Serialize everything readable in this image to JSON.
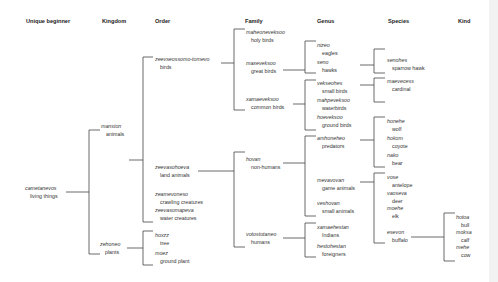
{
  "headers": {
    "unique_beginner": "Unique beginner",
    "kingdom": "Kingdom",
    "order": "Order",
    "family": "Family",
    "genus": "Genus",
    "species": "Species",
    "kind": "Kind"
  },
  "unique_beginner": {
    "name": "cametanevos",
    "gloss": "living things"
  },
  "kingdom": [
    {
      "name": "manston",
      "gloss": "animals"
    },
    {
      "name": "zehoneo",
      "gloss": "plants"
    }
  ],
  "order": [
    {
      "name": "zeevseossomo-tomevo",
      "gloss": "birds"
    },
    {
      "name": "zeevasohoeva",
      "gloss": "land animals"
    },
    {
      "name": "zeamevoneso",
      "gloss": "crawling creatures"
    },
    {
      "name": "zeevasomapeva",
      "gloss": "water creatures"
    },
    {
      "name": "hoxzz",
      "gloss": "tree"
    },
    {
      "name": "moez",
      "gloss": "ground plant"
    }
  ],
  "family": [
    {
      "name": "maheoneveksoo",
      "gloss": "holy birds"
    },
    {
      "name": "maxeveksoo",
      "gloss": "great birds"
    },
    {
      "name": "xamaeveksoo",
      "gloss": "common birds"
    },
    {
      "name": "hovan",
      "gloss": "non-humans"
    },
    {
      "name": "votostotaneo",
      "gloss": "humans"
    }
  ],
  "genus": [
    {
      "name": "nizeo",
      "gloss": "eagles"
    },
    {
      "name": "seno",
      "gloss": "hawks"
    },
    {
      "name": "vekseohes",
      "gloss": "small birds"
    },
    {
      "name": "mahpeveksoo",
      "gloss": "waterbirds"
    },
    {
      "name": "hoeveksoo",
      "gloss": "ground birds"
    },
    {
      "name": "amhoneheo",
      "gloss": "predators"
    },
    {
      "name": "mevavovan",
      "gloss": "game animals"
    },
    {
      "name": "veshovan",
      "gloss": "small animals"
    },
    {
      "name": "xamaehestan",
      "gloss": "Indians"
    },
    {
      "name": "hestohestan",
      "gloss": "foreigners"
    }
  ],
  "species": [
    {
      "name": "senohes",
      "gloss": "sparrow hawk"
    },
    {
      "name": "maevecess",
      "gloss": "cardinal"
    },
    {
      "name": "honehe",
      "gloss": "wolf"
    },
    {
      "name": "hokom",
      "gloss": "coyote"
    },
    {
      "name": "nako",
      "gloss": "bear"
    },
    {
      "name": "vose",
      "gloss": "antelope"
    },
    {
      "name": "vaoseva",
      "gloss": "deer"
    },
    {
      "name": "moehe",
      "gloss": "elk"
    },
    {
      "name": "esevon",
      "gloss": "buffalo"
    }
  ],
  "kind": [
    {
      "name": "hotoa",
      "gloss": "bull"
    },
    {
      "name": "moksa",
      "gloss": "calf"
    },
    {
      "name": "mehe",
      "gloss": "cow"
    }
  ]
}
